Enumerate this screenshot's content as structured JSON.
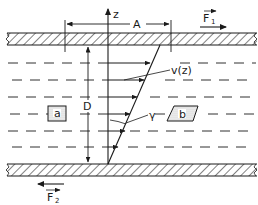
{
  "diagram": {
    "type": "couette-flow-schematic",
    "labels": {
      "z_axis": "z",
      "area": "A",
      "force_top": "F",
      "force_top_sub": "1",
      "force_bottom": "F",
      "force_bottom_sub": "2",
      "gap": "D",
      "velocity_profile": "v(z)",
      "shear_angle": "γ",
      "element_a": "a",
      "element_b": "b"
    },
    "colors": {
      "ink": "#1a1a1a",
      "background": "#ffffff"
    }
  }
}
